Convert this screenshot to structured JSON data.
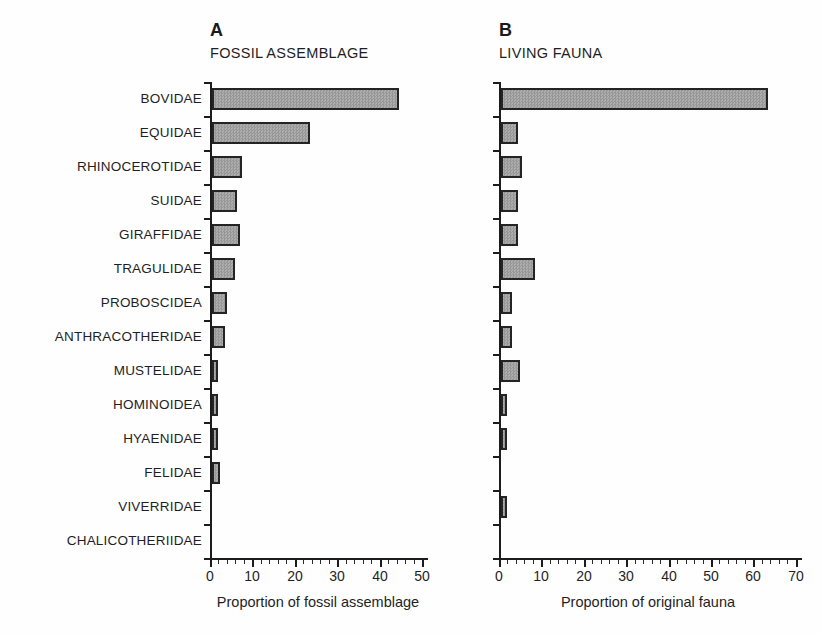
{
  "figure": {
    "background": "#fefefe",
    "bar_fill": "#a4a4a4",
    "bar_border": "#242424",
    "axis_color": "#1c1c1c"
  },
  "categories": [
    "BOVIDAE",
    "EQUIDAE",
    "RHINOCEROTIDAE",
    "SUIDAE",
    "GIRAFFIDAE",
    "TRAGULIDAE",
    "PROBOSCIDEA",
    "ANTHRACOTHERIDAE",
    "MUSTELIDAE",
    "HOMINOIDEA",
    "HYAENIDAE",
    "FELIDAE",
    "VIVERRIDAE",
    "CHALICOTHERIIDAE"
  ],
  "chart_data": [
    {
      "type": "bar",
      "orientation": "horizontal",
      "panel": "A",
      "title": "FOSSIL ASSEMBLAGE",
      "categories": [
        "BOVIDAE",
        "EQUIDAE",
        "RHINOCEROTIDAE",
        "SUIDAE",
        "GIRAFFIDAE",
        "TRAGULIDAE",
        "PROBOSCIDEA",
        "ANTHRACOTHERIDAE",
        "MUSTELIDAE",
        "HOMINOIDEA",
        "HYAENIDAE",
        "FELIDAE",
        "VIVERRIDAE",
        "CHALICOTHERIIDAE"
      ],
      "values": [
        44,
        23,
        7,
        6,
        6.5,
        5.5,
        3.5,
        3,
        1.5,
        1.5,
        1.5,
        2,
        0,
        0
      ],
      "xlabel": "Proportion of fossil assemblage",
      "xlim": [
        0,
        50
      ],
      "xticks": [
        0,
        10,
        20,
        30,
        40,
        50
      ],
      "minor_tick_step": 2,
      "grid": false,
      "legend": "none"
    },
    {
      "type": "bar",
      "orientation": "horizontal",
      "panel": "B",
      "title": "LIVING FAUNA",
      "categories": [
        "BOVIDAE",
        "EQUIDAE",
        "RHINOCEROTIDAE",
        "SUIDAE",
        "GIRAFFIDAE",
        "TRAGULIDAE",
        "PROBOSCIDEA",
        "ANTHRACOTHERIDAE",
        "MUSTELIDAE",
        "HOMINOIDEA",
        "HYAENIDAE",
        "FELIDAE",
        "VIVERRIDAE",
        "CHALICOTHERIIDAE"
      ],
      "values": [
        63,
        4,
        5,
        4,
        4,
        8,
        2.5,
        2.5,
        4.5,
        1.5,
        1.5,
        0,
        1.5,
        0
      ],
      "xlabel": "Proportion of original fauna",
      "xlim": [
        0,
        70
      ],
      "xticks": [
        0,
        10,
        20,
        30,
        40,
        50,
        60,
        70
      ],
      "minor_tick_step": 2,
      "grid": false,
      "legend": "none"
    }
  ]
}
